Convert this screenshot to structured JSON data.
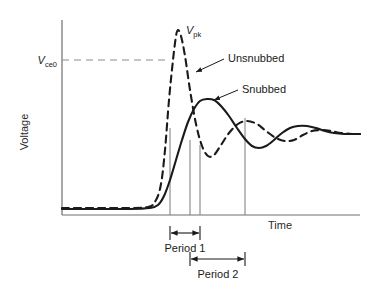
{
  "chart_data": {
    "type": "line",
    "title": "",
    "xlabel": "Time",
    "ylabel": "Voltage",
    "grid": false,
    "legend_position": "inline-annotations",
    "axis": {
      "x_range_px": [
        62,
        360
      ],
      "y_range_px": [
        20,
        215
      ],
      "x_axis_arrow": false,
      "y_axis_arrow": false,
      "ticks_shown": false
    },
    "reference_lines": [
      {
        "name": "Vce0",
        "label": "V",
        "label_sub": "ce0",
        "orientation": "horizontal",
        "style": "dashed",
        "color": "#8c8c8c",
        "y_px": 60,
        "x_start_px": 62,
        "x_end_px": 170
      }
    ],
    "annotations": [
      {
        "name": "peak-label",
        "label": "V",
        "label_sub": "pk",
        "x_px": 186,
        "y_px": 34,
        "leader": false
      },
      {
        "name": "unsnubbed-label",
        "label": "Unsnubbed",
        "x_px": 228,
        "y_px": 62,
        "leader": true,
        "leader_to_px": [
          194,
          73
        ]
      },
      {
        "name": "snubbed-label",
        "label": "Snubbed",
        "x_px": 242,
        "y_px": 93,
        "leader": true,
        "leader_to_px": [
          212,
          101
        ]
      }
    ],
    "dimension_markers": [
      {
        "name": "period-1",
        "label": "Period 1",
        "x_start_px": 170,
        "x_end_px": 200,
        "y_px": 233,
        "label_y_px": 249,
        "label_x_px": 185
      },
      {
        "name": "period-2",
        "label": "Period 2",
        "x_start_px": 190,
        "x_end_px": 245,
        "y_px": 259,
        "label_y_px": 275,
        "label_x_px": 218
      }
    ],
    "marker_lines_x_px": [
      170,
      190,
      200,
      245
    ],
    "series": [
      {
        "name": "Unsnubbed",
        "style": "dashed",
        "color": "#1a1a1a",
        "description": "Large overshoot to Vpk then underdamped ringing",
        "points_px": [
          [
            62,
            208
          ],
          [
            120,
            208
          ],
          [
            148,
            207
          ],
          [
            156,
            200
          ],
          [
            161,
            184
          ],
          [
            165,
            150
          ],
          [
            169,
            100
          ],
          [
            173,
            60
          ],
          [
            176,
            36
          ],
          [
            178,
            30
          ],
          [
            181,
            36
          ],
          [
            185,
            56
          ],
          [
            190,
            90
          ],
          [
            196,
            124
          ],
          [
            202,
            146
          ],
          [
            208,
            156
          ],
          [
            214,
            155
          ],
          [
            221,
            145
          ],
          [
            229,
            133
          ],
          [
            238,
            124
          ],
          [
            247,
            121
          ],
          [
            257,
            124
          ],
          [
            266,
            131
          ],
          [
            276,
            138
          ],
          [
            285,
            141
          ],
          [
            294,
            140
          ],
          [
            303,
            135
          ],
          [
            312,
            131
          ],
          [
            322,
            130
          ],
          [
            331,
            131
          ],
          [
            341,
            133
          ],
          [
            352,
            134
          ],
          [
            360,
            134
          ]
        ]
      },
      {
        "name": "Snubbed",
        "style": "solid",
        "color": "#1a1a1a",
        "description": "Damped response with reduced overshoot",
        "points_px": [
          [
            62,
            209
          ],
          [
            130,
            209
          ],
          [
            150,
            208
          ],
          [
            158,
            205
          ],
          [
            164,
            196
          ],
          [
            170,
            180
          ],
          [
            176,
            160
          ],
          [
            182,
            140
          ],
          [
            188,
            122
          ],
          [
            194,
            109
          ],
          [
            200,
            101
          ],
          [
            207,
            99
          ],
          [
            214,
            100
          ],
          [
            221,
            106
          ],
          [
            229,
            116
          ],
          [
            237,
            128
          ],
          [
            245,
            139
          ],
          [
            252,
            146
          ],
          [
            259,
            148
          ],
          [
            266,
            146
          ],
          [
            274,
            140
          ],
          [
            282,
            133
          ],
          [
            290,
            128
          ],
          [
            298,
            126
          ],
          [
            307,
            126
          ],
          [
            316,
            128
          ],
          [
            325,
            131
          ],
          [
            334,
            133
          ],
          [
            344,
            134
          ],
          [
            352,
            134
          ],
          [
            360,
            134
          ]
        ]
      }
    ],
    "baseline_px": 208.5
  }
}
